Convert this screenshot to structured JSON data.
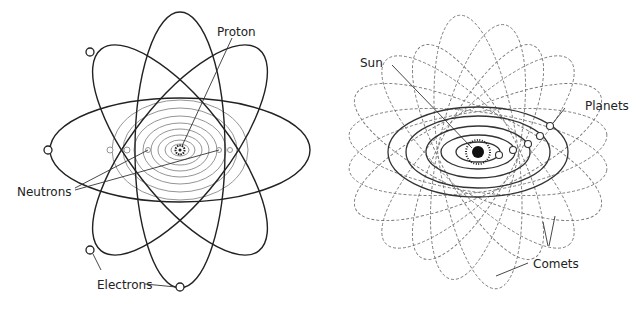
{
  "atom": {
    "labels": {
      "proton": "Proton",
      "neutrons": "Neutrons",
      "electrons": "Electrons"
    }
  },
  "solar_system": {
    "labels": {
      "sun": "Sun",
      "planets": "Planets",
      "comets": "Comets"
    }
  }
}
